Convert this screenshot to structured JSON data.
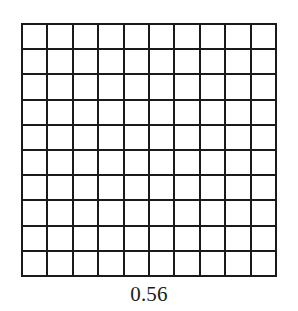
{
  "figure": {
    "name": "hundredths-grid-model",
    "caption": "0.56",
    "background_color": "#ffffff",
    "line_color": "#1a1a1a",
    "cell_fill_color": "#ffffff",
    "shaded_fill_color": "#4a4a4a",
    "caption_color": "#1c1c1c"
  },
  "chart_data": {
    "type": "heatmap",
    "title": "",
    "subtitle": "",
    "xlabel": "",
    "ylabel": "",
    "rows": 10,
    "columns": 10,
    "total_cells": 100,
    "shaded_cells": 0,
    "grid": true,
    "legend": "none",
    "annotations": [
      "0.56"
    ],
    "values": [
      [
        0,
        0,
        0,
        0,
        0,
        0,
        0,
        0,
        0,
        0
      ],
      [
        0,
        0,
        0,
        0,
        0,
        0,
        0,
        0,
        0,
        0
      ],
      [
        0,
        0,
        0,
        0,
        0,
        0,
        0,
        0,
        0,
        0
      ],
      [
        0,
        0,
        0,
        0,
        0,
        0,
        0,
        0,
        0,
        0
      ],
      [
        0,
        0,
        0,
        0,
        0,
        0,
        0,
        0,
        0,
        0
      ],
      [
        0,
        0,
        0,
        0,
        0,
        0,
        0,
        0,
        0,
        0
      ],
      [
        0,
        0,
        0,
        0,
        0,
        0,
        0,
        0,
        0,
        0
      ],
      [
        0,
        0,
        0,
        0,
        0,
        0,
        0,
        0,
        0,
        0
      ],
      [
        0,
        0,
        0,
        0,
        0,
        0,
        0,
        0,
        0,
        0
      ],
      [
        0,
        0,
        0,
        0,
        0,
        0,
        0,
        0,
        0,
        0
      ]
    ]
  }
}
